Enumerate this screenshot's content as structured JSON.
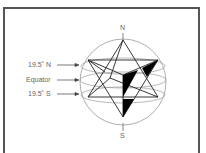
{
  "diagram": {
    "type": "star tetrahedron inscribed in sphere",
    "labels": {
      "north_latitude": "19.5˚ N",
      "equator": "Equator",
      "south_latitude": "19.5˚ S",
      "north_pole": "N",
      "south_pole": "S"
    },
    "colors": {
      "frame": "#555555",
      "sphere": "#999999",
      "lines": "#222222",
      "fill": "#000000",
      "text": "#666666"
    }
  }
}
